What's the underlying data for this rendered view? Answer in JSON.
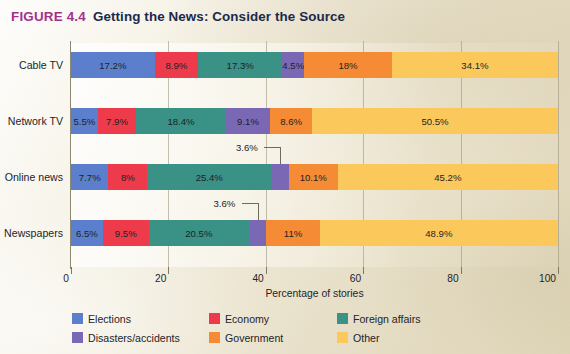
{
  "figure": {
    "number": "FIGURE 4.4",
    "title": "Getting the News: Consider the Source"
  },
  "colors": {
    "elections": "#5b7fcc",
    "economy": "#ee3b4b",
    "foreign_affairs": "#3a9186",
    "disasters_accidents": "#7b68b5",
    "government": "#f68b35",
    "other": "#fbc85c",
    "figure_number": "#a3318d",
    "title_text": "#1b2a4a",
    "page_background": "#e6dec6"
  },
  "chart_data": {
    "type": "bar",
    "orientation": "horizontal",
    "stacked": true,
    "title": "Getting the News: Consider the Source",
    "xlabel": "Percentage of stories",
    "ylabel": "",
    "xlim": [
      0,
      100
    ],
    "xticks": [
      0,
      20,
      40,
      60,
      80,
      100
    ],
    "xtick_labels": [
      "0",
      "20",
      "40",
      "60",
      "80",
      "100"
    ],
    "grid": true,
    "legend_position": "bottom-left",
    "categories": [
      "Cable TV",
      "Network TV",
      "Online news",
      "Newspapers"
    ],
    "series": [
      {
        "name": "Elections",
        "color": "#5b7fcc",
        "values": [
          17.2,
          5.5,
          7.7,
          6.5
        ],
        "labels": [
          "17.2%",
          "5.5%",
          "7.7%",
          "6.5%"
        ]
      },
      {
        "name": "Economy",
        "color": "#ee3b4b",
        "values": [
          8.9,
          7.9,
          8.0,
          9.5
        ],
        "labels": [
          "8.9%",
          "7.9%",
          "8%",
          "9.5%"
        ]
      },
      {
        "name": "Foreign affairs",
        "color": "#3a9186",
        "values": [
          17.3,
          18.4,
          25.4,
          20.5
        ],
        "labels": [
          "17.3%",
          "18.4%",
          "25.4%",
          "20.5%"
        ]
      },
      {
        "name": "Disasters/accidents",
        "color": "#7b68b5",
        "values": [
          4.5,
          9.1,
          3.6,
          3.6
        ],
        "labels": [
          "4.5%",
          "9.1%",
          "3.6%",
          "3.6%"
        ]
      },
      {
        "name": "Government",
        "color": "#f68b35",
        "values": [
          18.0,
          8.6,
          10.1,
          11.0
        ],
        "labels": [
          "18%",
          "8.6%",
          "10.1%",
          "11%"
        ]
      },
      {
        "name": "Other",
        "color": "#fbc85c",
        "values": [
          34.1,
          50.5,
          45.2,
          48.9
        ],
        "labels": [
          "34.1%",
          "50.5%",
          "45.2%",
          "48.9%"
        ]
      }
    ],
    "callouts": [
      {
        "category": "Online news",
        "series": "Disasters/accidents",
        "label": "3.6%"
      },
      {
        "category": "Newspapers",
        "series": "Disasters/accidents",
        "label": "3.6%"
      }
    ]
  },
  "legend": {
    "items": [
      {
        "label": "Elections",
        "color": "#5b7fcc"
      },
      {
        "label": "Economy",
        "color": "#ee3b4b"
      },
      {
        "label": "Foreign affairs",
        "color": "#3a9186"
      },
      {
        "label": "Disasters/accidents",
        "color": "#7b68b5"
      },
      {
        "label": "Government",
        "color": "#f68b35"
      },
      {
        "label": "Other",
        "color": "#fbc85c"
      }
    ]
  }
}
